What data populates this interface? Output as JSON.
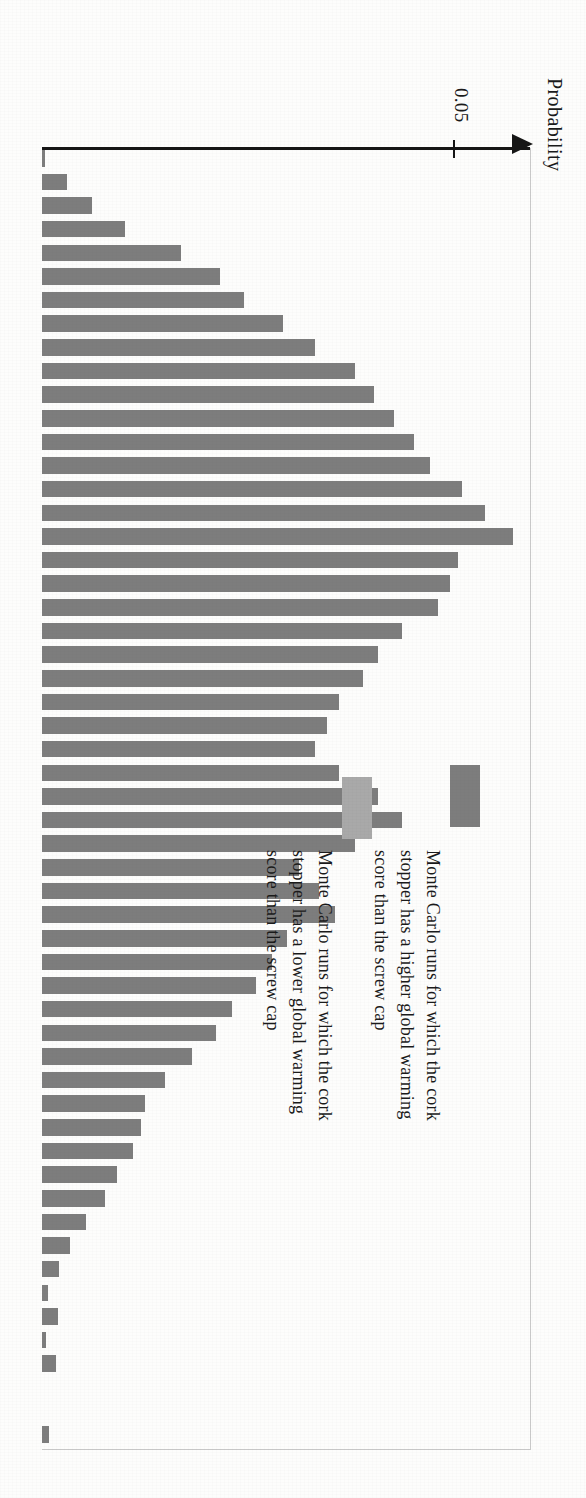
{
  "axis": {
    "title": "Probability",
    "tick_label": "0.05"
  },
  "legend": {
    "entries": [
      {
        "name": "higher",
        "color": "#7d7d7d",
        "label": "Monte Carlo runs for which the cork\nstopper has a higher global warming\nscore than the screw cap"
      },
      {
        "name": "lower",
        "color": "#a9a9a9",
        "label": "Monte Carlo runs for which the cork\nstopper has a lower global warming\nscore than the screw cap"
      }
    ]
  },
  "chart_data": {
    "type": "bar",
    "orientation": "horizontal",
    "title": "",
    "xlabel": "Probability",
    "ylabel": "",
    "xlim": [
      0,
      0.0595
    ],
    "grid": false,
    "legend_position": "inside-right",
    "ticks": [
      0.05
    ],
    "bar_color": "#7d7d7d",
    "series": [
      {
        "name": "Monte Carlo runs for which the cork stopper has a higher global warming score than the screw cap",
        "color": "#7d7d7d",
        "values": [
          0.0004,
          0.0031,
          0.0063,
          0.0105,
          0.0175,
          0.0225,
          0.0255,
          0.0305,
          0.0345,
          0.0395,
          0.042,
          0.0445,
          0.047,
          0.049,
          0.053,
          0.056,
          0.0595,
          0.0525,
          0.0515,
          0.05,
          0.0455,
          0.0425,
          0.0405,
          0.0375,
          0.036,
          0.0345,
          0.0375,
          0.0425,
          0.0455,
          0.0395,
          0.0325,
          0.035,
          0.037,
          0.031,
          0.029,
          0.027,
          0.024,
          0.022,
          0.019,
          0.0155,
          0.013,
          0.0125,
          0.0115,
          0.0095,
          0.008,
          0.0055,
          0.0035,
          0.0022,
          0.0008,
          0.002,
          0.0005,
          0.0018,
          0.0,
          0.0,
          0.0009
        ]
      }
    ]
  }
}
